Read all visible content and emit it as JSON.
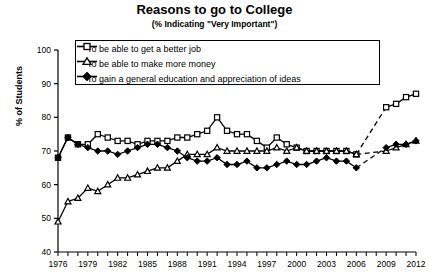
{
  "chart_data": {
    "type": "line",
    "title": "Reasons to go to College",
    "subtitle": "(% Indicating \"Very Important\")",
    "xlabel": "",
    "ylabel": "% of Students",
    "ylim": [
      40,
      100
    ],
    "ytick_step": 10,
    "yticks": [
      40,
      50,
      60,
      70,
      80,
      90,
      100
    ],
    "xlim": [
      1976,
      2012
    ],
    "xticks_labeled": [
      1976,
      1979,
      1982,
      1985,
      1988,
      1991,
      1994,
      1997,
      2000,
      2003,
      2006,
      2009,
      2012
    ],
    "xtick_minor_step": 1,
    "grid": false,
    "legend_position": "upper-center-inside",
    "data_gap_years": [
      2007,
      2008
    ],
    "gap_style": "dashed",
    "x": [
      1976,
      1977,
      1978,
      1979,
      1980,
      1981,
      1982,
      1983,
      1984,
      1985,
      1986,
      1987,
      1988,
      1989,
      1990,
      1991,
      1992,
      1993,
      1994,
      1995,
      1996,
      1997,
      1998,
      1999,
      2000,
      2001,
      2002,
      2003,
      2004,
      2005,
      2006,
      2009,
      2010,
      2011,
      2012
    ],
    "series": [
      {
        "name": "To be able to get a better job",
        "marker": "open-square",
        "values": [
          68,
          74,
          72,
          72,
          75,
          74,
          73,
          73,
          72,
          73,
          73,
          73,
          74,
          74,
          75,
          76,
          80,
          76,
          75,
          75,
          73,
          71,
          74,
          72,
          71,
          70,
          70,
          70,
          70,
          70,
          69,
          83,
          84,
          86,
          87
        ]
      },
      {
        "name": "To be able to make more money",
        "marker": "open-triangle",
        "values": [
          49,
          55,
          56,
          59,
          58,
          60,
          62,
          62,
          63,
          64,
          65,
          65,
          67,
          69,
          69,
          69,
          71,
          70,
          70,
          70,
          70,
          70,
          71,
          70,
          71,
          70,
          70,
          70,
          70,
          70,
          69,
          70,
          71,
          72,
          73
        ]
      },
      {
        "name": "To gain a general education and appreciation of ideas",
        "marker": "filled-diamond",
        "values": [
          68,
          74,
          72,
          71,
          70,
          70,
          69,
          70,
          71,
          72,
          72,
          71,
          70,
          68,
          67,
          67,
          68,
          66,
          66,
          67,
          65,
          65,
          66,
          67,
          66,
          66,
          67,
          68,
          67,
          67,
          65,
          71,
          72,
          72,
          73
        ]
      }
    ]
  }
}
